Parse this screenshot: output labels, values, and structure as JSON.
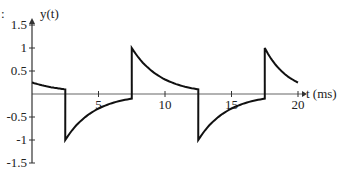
{
  "fragment_label": ":",
  "chart_data": {
    "type": "line",
    "title": "",
    "xlabel": "t (ms)",
    "ylabel": "y(t)",
    "xlim": [
      0,
      20
    ],
    "ylim": [
      -1.5,
      1.5
    ],
    "x_ticks": [
      5,
      10,
      15,
      20
    ],
    "x_tick_labels": [
      "5",
      "10",
      "15",
      "20"
    ],
    "y_ticks": [
      1.5,
      1,
      0.5,
      -0.5,
      -1,
      -1.5
    ],
    "y_tick_labels": [
      "1.5",
      "1",
      "0.5",
      "-0.5",
      "-1",
      "-1.5"
    ],
    "grid": false,
    "legend": null,
    "series": [
      {
        "name": "y(t)",
        "description": "Exponentially decaying square-wave response; jumps of magnitude ~1.1 at t = 2.5, 7.5, 12.5, 17.5 ms",
        "points": [
          [
            0,
            0.25
          ],
          [
            2.5,
            0.1
          ],
          [
            2.5,
            -1.0
          ],
          [
            7.5,
            -0.1
          ],
          [
            7.5,
            1.0
          ],
          [
            12.5,
            0.1
          ],
          [
            12.5,
            -1.0
          ],
          [
            17.5,
            -0.1
          ],
          [
            17.5,
            1.0
          ],
          [
            20,
            0.25
          ]
        ],
        "jumps_at": [
          2.5,
          7.5,
          12.5,
          17.5
        ],
        "peak_value": 1.0,
        "trough_value": -1.0
      }
    ]
  }
}
